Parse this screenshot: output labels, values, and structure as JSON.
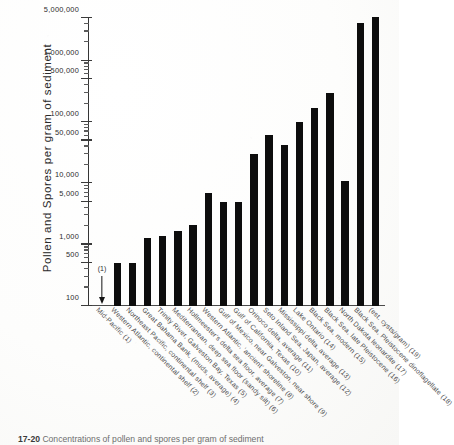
{
  "chart_data": {
    "type": "bar",
    "title": "",
    "xlabel": "",
    "ylabel": "Pollen and Spores per gram of sediment",
    "yscale": "log",
    "ylim": [
      100,
      5000000
    ],
    "grid": false,
    "legend": "none",
    "ytick_labels": [
      "100",
      "500",
      "1,000",
      "5,000",
      "10,000",
      "50,000",
      "100,000",
      "500,000",
      "1,000,000",
      "5,000,000"
    ],
    "ytick_values": [
      100,
      500,
      1000,
      5000,
      10000,
      50000,
      100000,
      500000,
      1000000,
      5000000
    ],
    "categories": [
      "Mid-Pacific (1)",
      "Western Atlantic, continental shelf (2)",
      "Northeast Pacific, continental shelf (3)",
      "Great Bahama Bank, (muds, average) (4)",
      "Trinity River, Galveston Bay, Texas (5)",
      "Mediterranean, deep sea floor (sandy silt) (6)",
      "Hollmeester's delta sea floor, average (7)",
      "Western Atlantic, 'ancient' shoreline (8)",
      "Gulf of Mexico, near Galveston, near shore (9)",
      "Gulf of California, Texas (10)",
      "Orinoco delta, average (11)",
      "Seto Inland Sea, Japan, average (12)",
      "Mississippi delta, average (13)",
      "Lake Ontario (14)",
      "Black Sea, modern (15)",
      "Black Sea, late Pleistocene (16)",
      "North Dakota leonardite (17)",
      "Black Sea, Pleistocene dinoflagellate (18)",
      "(est. cysts/gram) (19)"
    ],
    "values": [
      60,
      500,
      500,
      1300,
      1400,
      1700,
      2100,
      7000,
      5000,
      5000,
      30000,
      62000,
      42000,
      100000,
      170000,
      300000,
      11000,
      4200000,
      5200000
    ],
    "annotations": [
      {
        "series_index": 1,
        "label": "(1)",
        "marker": "down-arrow",
        "note": "value below axis minimum"
      }
    ]
  },
  "caption": {
    "figure_number": "17-20",
    "text": "Concentrations of pollen and spores per gram of sediment"
  }
}
